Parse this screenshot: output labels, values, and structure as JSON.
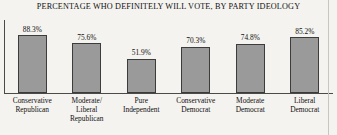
{
  "chart_data": {
    "type": "bar",
    "title": "PERCENTAGE WHO DEFINITELY WILL VOTE, BY PARTY IDEOLOGY",
    "xlabel": "",
    "ylabel": "",
    "ylim": [
      0,
      100
    ],
    "grid": false,
    "legend": "none",
    "categories": [
      "Conservative Republican",
      "Moderate/ Liberal Republican",
      "Pure Independent",
      "Conservative Democrat",
      "Moderate Democrat",
      "Liberal Democrat"
    ],
    "category_lines": [
      [
        "Conservative",
        "Republican"
      ],
      [
        "Moderate/",
        "Liberal",
        "Republican"
      ],
      [
        "Pure",
        "Independent"
      ],
      [
        "Conservative",
        "Democrat"
      ],
      [
        "Moderate",
        "Democrat"
      ],
      [
        "Liberal",
        "Democrat"
      ]
    ],
    "values": [
      88.3,
      75.6,
      51.9,
      70.3,
      74.8,
      85.2
    ],
    "value_labels": [
      "88.3%",
      "75.6%",
      "51.9%",
      "70.3%",
      "74.8%",
      "85.2%"
    ],
    "colors": {
      "bar_fill": "#9a9a9a",
      "bar_border": "#3c3c3c",
      "axis": "#4a4a4a",
      "background": "#f4f3ef",
      "text": "#111111"
    }
  }
}
